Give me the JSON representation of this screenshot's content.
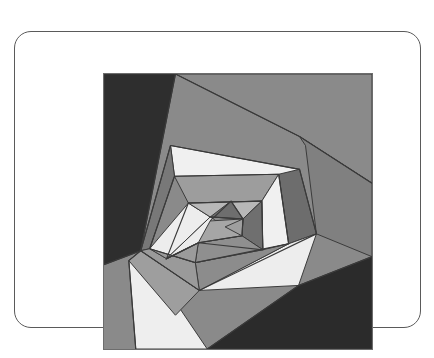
{
  "page": {
    "background_color": "#ffffff",
    "width": 434,
    "height": 358
  },
  "card": {
    "name": "artwork-card",
    "border_color": "#5a5a5a",
    "fill_color": "#ffffff",
    "corner_radius": 17
  },
  "artwork": {
    "title": "",
    "kind": "geometric-abstract",
    "description": "Nested rotating pentagon spiral composed of grayscale quadrilateral patches, quilt / log-cabin style",
    "border_color": "#6d6d6d",
    "canvas": {
      "width": 270,
      "height": 277
    },
    "palette": {
      "near_black": "#2a2a2a",
      "very_dark": "#333333",
      "dark_gray": "#575757",
      "mid_dark_gray": "#6b6b6b",
      "mid_gray": "#7d7d7d",
      "gray": "#8a8a8a",
      "light_mid_gray": "#9a9a9a",
      "light_gray": "#a8a8a8",
      "pale_gray": "#bdbdbd",
      "near_white": "#e8e8e8",
      "white": "#f2f2f2",
      "seam": "#3a3a3a"
    },
    "patches": [
      {
        "id": "bg-top-band",
        "name": "background-top-band",
        "fill": "#8a8a8a",
        "points": "0,0 270,0 270,110 197,63 72,0"
      },
      {
        "id": "bg-left-dark",
        "name": "background-left-dark",
        "fill": "#2e2e2e",
        "points": "0,0 72,0 37,178 0,192"
      },
      {
        "id": "bg-right-gray",
        "name": "background-right-gray",
        "fill": "#808080",
        "points": "197,63 270,110 270,184 214,161 203,72"
      },
      {
        "id": "bg-bottom-dark",
        "name": "background-bottom-dark",
        "fill": "#2b2b2b",
        "points": "270,184 270,277 104,277 196,213"
      },
      {
        "id": "ring1-top-white",
        "name": "ring1-top-white-band",
        "fill": "#f0f0f0",
        "points": "67,72 197,96 195,127 71,103"
      },
      {
        "id": "ring1-right-dark",
        "name": "ring1-right-dark-band",
        "fill": "#6d6d6d",
        "points": "197,96 214,161 186,171 176,101"
      },
      {
        "id": "ring1-bottom-white",
        "name": "ring1-bottom-white-band",
        "fill": "#ededed",
        "points": "214,161 196,213 96,218 186,171"
      },
      {
        "id": "ring1-left-white",
        "name": "ring1-bottom-left-white",
        "fill": "#eeeeee",
        "points": "37,178 104,277 32,277 25,188"
      },
      {
        "id": "ring1-leftband",
        "name": "ring1-left-gray-band",
        "fill": "#9e9e9e",
        "points": "37,178 96,218 72,243 25,188"
      },
      {
        "id": "ring2-left-dark",
        "name": "ring2-left-dark-band",
        "fill": "#787878",
        "points": "67,72 71,103 46,176 37,178"
      },
      {
        "id": "ring2-top-mid",
        "name": "ring2-top-midgray-band",
        "fill": "#9d9d9d",
        "points": "71,103 176,101 159,128 85,130"
      },
      {
        "id": "ring2-right-white",
        "name": "ring2-right-white-band",
        "fill": "#f0f0f0",
        "points": "176,101 186,171 160,177 159,128"
      },
      {
        "id": "ring2-bottom-mid",
        "name": "ring2-bottom-mid-band",
        "fill": "#8c8c8c",
        "points": "186,171 96,218 92,190 160,177"
      },
      {
        "id": "ring2-ll-gray",
        "name": "ring2-lower-left-gray",
        "fill": "#9a9a9a",
        "points": "46,176 92,190 96,218 37,178"
      },
      {
        "id": "ring3-left-white",
        "name": "ring3-left-white-band",
        "fill": "#ededed",
        "points": "85,130 46,176 63,186 107,144"
      },
      {
        "id": "ring3-top-pale",
        "name": "ring3-top-pale-band",
        "fill": "#b8b8b8",
        "points": "85,130 159,128 140,146 107,144"
      },
      {
        "id": "ring3-right-dark",
        "name": "ring3-right-dark-band",
        "fill": "#6f6f6f",
        "points": "159,128 160,177 139,163 140,146"
      },
      {
        "id": "ring3-bottom-gray",
        "name": "ring3-bottom-gray-band",
        "fill": "#8f8f8f",
        "points": "160,177 92,190 95,170 139,163"
      },
      {
        "id": "ring3-ll-pale",
        "name": "ring3-lower-left-pale",
        "fill": "#9b9b9b",
        "points": "63,186 95,170 92,190 46,176"
      },
      {
        "id": "ring4-left-white",
        "name": "ring4-inner-left-white",
        "fill": "#ececec",
        "points": "107,144 63,186 95,170 122,154"
      },
      {
        "id": "ring4-top-dark",
        "name": "ring4-inner-top-dark-tri",
        "fill": "#6e6e6e",
        "points": "107,144 140,146 128,128"
      },
      {
        "id": "ring4-core",
        "name": "ring4-core-pentagon",
        "fill": "#a6a6a6",
        "points": "107,148 140,146 139,163 95,170"
      },
      {
        "id": "ring4-core-right",
        "name": "ring4-core-right-wedge",
        "fill": "#9f9f9f",
        "points": "140,146 139,163 122,154"
      }
    ],
    "seam_lines": [
      {
        "name": "seam-top-diagonal",
        "points": "72,0 197,63 270,110"
      },
      {
        "name": "seam-left-diagonal",
        "points": "72,0 37,178 0,192"
      },
      {
        "name": "seam-bottom-diagonal",
        "points": "270,184 196,213 104,277"
      },
      {
        "name": "seam-outer-pentagon",
        "points": "67,72 197,96 214,161 96,218 37,178 67,72"
      },
      {
        "name": "seam-ring1-inner",
        "points": "71,103 176,101 186,171 92,190 46,176 71,103"
      },
      {
        "name": "seam-ring2-inner",
        "points": "85,130 159,128 160,177 95,170 63,186 85,130"
      },
      {
        "name": "seam-ring3-inner",
        "points": "107,144 140,146 139,163 95,170 63,186"
      },
      {
        "name": "seam-left-white-edge",
        "points": "37,178 25,188 32,277"
      },
      {
        "name": "seam-core-triangle",
        "points": "107,148 128,128 140,146"
      }
    ]
  }
}
